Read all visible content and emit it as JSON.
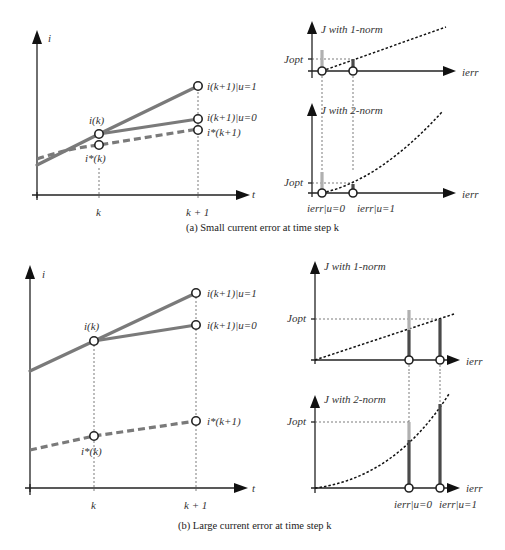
{
  "figure": {
    "panel_a": {
      "caption": "(a)  Small current error at time step k",
      "left_plot": {
        "y_axis_label": "i",
        "x_axis_label": "t",
        "x_ticks": [
          "k",
          "k + 1"
        ],
        "point_labels": {
          "i_k": "i(k)",
          "i_star_k": "i*(k)",
          "i_k1_u1": "i(k+1)|u=1",
          "i_k1_u0": "i(k+1)|u=0",
          "i_star_k1": "i*(k+1)"
        }
      },
      "top_right_plot": {
        "title": "J with 1-norm",
        "y_marker": "Jopt",
        "x_axis_label": "ierr"
      },
      "bottom_right_plot": {
        "title": "J with 2-norm",
        "y_marker": "Jopt",
        "x_axis_label": "ierr",
        "x_ticks": [
          "ierr|u=0",
          "ierr|u=1"
        ]
      }
    },
    "panel_b": {
      "caption": "(b)  Large current error at time step k",
      "left_plot": {
        "y_axis_label": "i",
        "x_axis_label": "t",
        "x_ticks": [
          "k",
          "k + 1"
        ],
        "point_labels": {
          "i_k": "i(k)",
          "i_star_k": "i*(k)",
          "i_k1_u1": "i(k+1)|u=1",
          "i_k1_u0": "i(k+1)|u=0",
          "i_star_k1": "i*(k+1)"
        }
      },
      "top_right_plot": {
        "title": "J with 1-norm",
        "y_marker": "Jopt",
        "x_axis_label": "ierr"
      },
      "bottom_right_plot": {
        "title": "J with 2-norm",
        "y_marker": "Jopt",
        "x_axis_label": "ierr",
        "x_ticks": [
          "ierr|u=0",
          "ierr|u=1"
        ]
      }
    },
    "colors": {
      "actual_current": "#7a7a7a",
      "reference_current": "#7a7a7a",
      "bar_light": "#b0b0b0",
      "bar_dark": "#4a4a4a",
      "axis": "#222222"
    }
  }
}
